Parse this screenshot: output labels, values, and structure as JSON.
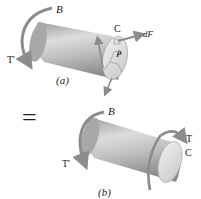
{
  "diagram": {
    "part_a": {
      "caption": "(a)",
      "labels": {
        "end_b": "B",
        "end_c": "C",
        "torque_left": "T'",
        "force": "dF",
        "radius": "ρ"
      }
    },
    "equals_sign": "=",
    "part_b": {
      "caption": "(b)",
      "labels": {
        "end_b": "B",
        "end_c": "C",
        "torque_left": "T'",
        "torque_right": "T"
      }
    },
    "colors": {
      "shaft_light": "#e6e6e6",
      "shaft_mid": "#b5b5b5",
      "shaft_dark": "#8a8a8a",
      "arrow": "#8c8c8c",
      "text": "#222222"
    }
  }
}
